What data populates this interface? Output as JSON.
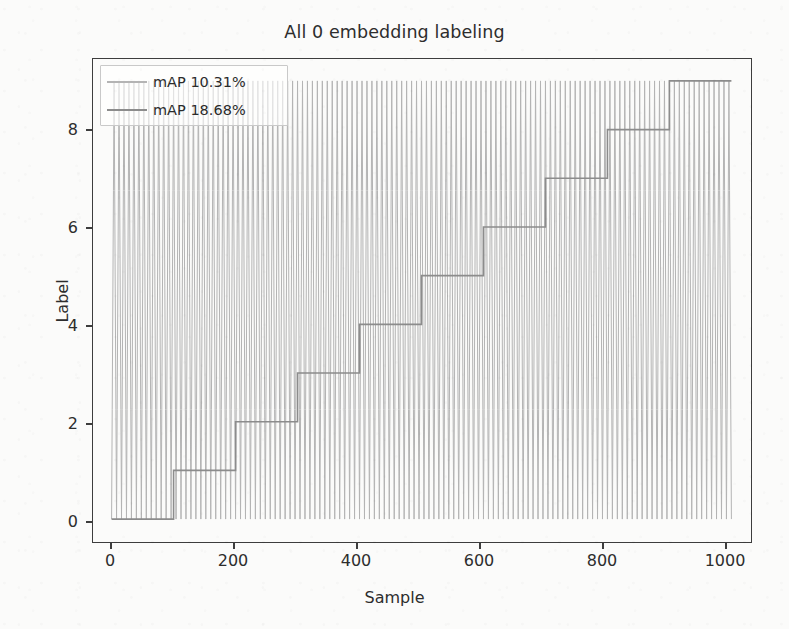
{
  "chart_data": {
    "type": "line",
    "title": "All 0 embedding labeling",
    "xlabel": "Sample",
    "ylabel": "Label",
    "xlim": [
      -30,
      1030
    ],
    "ylim": [
      -0.45,
      9.45
    ],
    "xticks": [
      0,
      200,
      400,
      600,
      800,
      1000
    ],
    "xtick_labels": [
      "0",
      "200",
      "400",
      "600",
      "800",
      "1000"
    ],
    "yticks": [
      0,
      2,
      4,
      6,
      8
    ],
    "ytick_labels": [
      "0",
      "2",
      "4",
      "6",
      "8"
    ],
    "grid": false,
    "legend_position": "upper left",
    "series": [
      {
        "name": "mAP 10.31%",
        "color": "#b4b4b4",
        "linewidth": 1.0,
        "description": "rapid sawtooth cycling 0 through 9 repeatedly across all 1000 samples",
        "pattern": "sawtooth",
        "period_samples": 8,
        "value_min": 0,
        "value_max": 9
      },
      {
        "name": "mAP 18.68%",
        "color": "#8c8c8c",
        "linewidth": 1.6,
        "description": "monotonic staircase increasing by 1 every 100 samples",
        "pattern": "staircase",
        "step_width_samples": 100,
        "steps": [
          {
            "x_start": 0,
            "x_end": 100,
            "y": 0
          },
          {
            "x_start": 100,
            "x_end": 200,
            "y": 1
          },
          {
            "x_start": 200,
            "x_end": 300,
            "y": 2
          },
          {
            "x_start": 300,
            "x_end": 400,
            "y": 3
          },
          {
            "x_start": 400,
            "x_end": 500,
            "y": 4
          },
          {
            "x_start": 500,
            "x_end": 600,
            "y": 5
          },
          {
            "x_start": 600,
            "x_end": 700,
            "y": 6
          },
          {
            "x_start": 700,
            "x_end": 800,
            "y": 7
          },
          {
            "x_start": 800,
            "x_end": 900,
            "y": 8
          },
          {
            "x_start": 900,
            "x_end": 1000,
            "y": 9
          }
        ]
      }
    ],
    "legend_entries": [
      {
        "label": "mAP 10.31%",
        "color": "#b4b4b4"
      },
      {
        "label": "mAP 18.68%",
        "color": "#8c8c8c"
      }
    ]
  },
  "legend": {
    "entry_0": "mAP 10.31%",
    "entry_1": "mAP 18.68%"
  },
  "axes": {
    "title": "All 0 embedding labeling",
    "xlabel": "Sample",
    "ylabel": "Label",
    "xtick_0": "0",
    "xtick_1": "200",
    "xtick_2": "400",
    "xtick_3": "600",
    "xtick_4": "800",
    "xtick_5": "1000",
    "ytick_0": "0",
    "ytick_1": "2",
    "ytick_2": "4",
    "ytick_3": "6",
    "ytick_4": "8"
  },
  "colors": {
    "series_light": "#b4b4b4",
    "series_dark": "#8c8c8c",
    "axis": "#3d3d3d",
    "text": "#2d2d2d",
    "background": "#fbfbfa"
  }
}
